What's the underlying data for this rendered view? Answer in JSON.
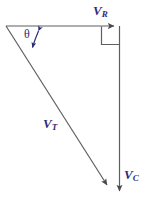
{
  "diagram": {
    "colors": {
      "line": "#5f5f63",
      "label": "#2b2b7c",
      "background": "#ffffff"
    },
    "labels": {
      "resistive_symbol": "V",
      "resistive_subscript": "R",
      "total_symbol": "V",
      "total_subscript": "T",
      "capacitive_symbol": "V",
      "capacitive_subscript": "C",
      "angle": "θ"
    },
    "geometry": {
      "origin": {
        "x": 6,
        "y": 26
      },
      "corner_right": {
        "x": 120,
        "y": 26
      },
      "corner_bottom": {
        "x": 120,
        "y": 197
      },
      "right_angle_marker": {
        "x": 101,
        "y": 26,
        "size": 18
      },
      "arrow_vr_tip": {
        "x": 120,
        "y": 26
      },
      "arrow_vc_tip": {
        "x": 120,
        "y": 197
      },
      "arrow_vt_tip": {
        "x": 110,
        "y": 190
      },
      "angle_arc_upper_tip": {
        "x": 38,
        "y": 28
      },
      "angle_arc_lower_tip": {
        "x": 31,
        "y": 50
      }
    },
    "vectors": [
      {
        "name": "V_R",
        "description": "horizontal resistive voltage vector pointing right"
      },
      {
        "name": "V_C",
        "description": "vertical capacitive voltage vector pointing down"
      },
      {
        "name": "V_T",
        "description": "total voltage vector, hypotenuse pointing down-right"
      }
    ]
  }
}
